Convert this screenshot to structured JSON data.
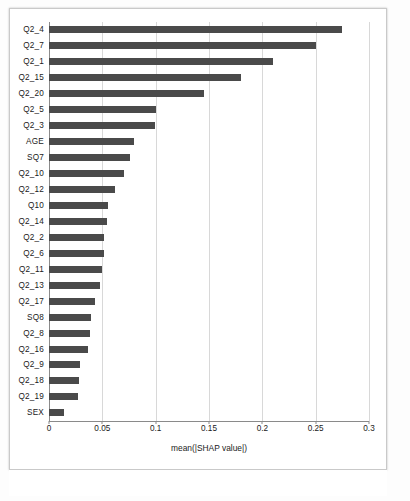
{
  "figure": {
    "background_color": "#ffffff",
    "bar_color": "#4a4a4a",
    "grid_color": "#d8d8d8"
  },
  "chart_data": {
    "type": "bar",
    "orientation": "horizontal",
    "title": "",
    "xlabel": "mean(|SHAP value|)",
    "ylabel": "",
    "xlim": [
      0,
      0.3
    ],
    "grid": true,
    "legend": "none",
    "xticks": [
      "0",
      "0.05",
      "0.1",
      "0.15",
      "0.2",
      "0.25",
      "0.3"
    ],
    "xtickvalues": [
      0,
      0.05,
      0.1,
      0.15,
      0.2,
      0.25,
      0.3
    ],
    "categories": [
      "Q2_4",
      "Q2_7",
      "Q2_1",
      "Q2_15",
      "Q2_20",
      "Q2_5",
      "Q2_3",
      "AGE",
      "SQ7",
      "Q2_10",
      "Q2_12",
      "Q10",
      "Q2_14",
      "Q2_2",
      "Q2_6",
      "Q2_11",
      "Q2_13",
      "Q2_17",
      "SQ8",
      "Q2_8",
      "Q2_16",
      "Q2_9",
      "Q2_18",
      "Q2_19",
      "SEX"
    ],
    "values": [
      0.275,
      0.25,
      0.21,
      0.18,
      0.145,
      0.1,
      0.099,
      0.08,
      0.076,
      0.07,
      0.062,
      0.055,
      0.054,
      0.052,
      0.052,
      0.05,
      0.048,
      0.043,
      0.039,
      0.038,
      0.037,
      0.029,
      0.028,
      0.027,
      0.014
    ]
  }
}
